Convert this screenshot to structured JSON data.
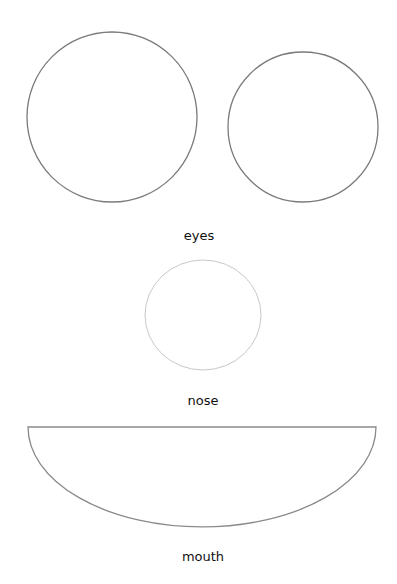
{
  "labels": {
    "eyes": "eyes",
    "nose": "nose",
    "mouth": "mouth"
  },
  "shapes": {
    "left_eye": {
      "cx": 112,
      "cy": 117,
      "r": 85,
      "stroke": "#7a7a7a"
    },
    "right_eye": {
      "cx": 303,
      "cy": 127,
      "r": 75,
      "stroke": "#7a7a7a"
    },
    "nose": {
      "cx": 203,
      "cy": 315,
      "rx": 58,
      "ry": 55,
      "stroke": "#c8c8c8"
    },
    "mouth": {
      "x1": 28,
      "x2": 376,
      "top": 427,
      "depth": 100,
      "stroke": "#8a8a8a"
    }
  },
  "colors": {
    "background": "#ffffff",
    "text": "#111111"
  }
}
